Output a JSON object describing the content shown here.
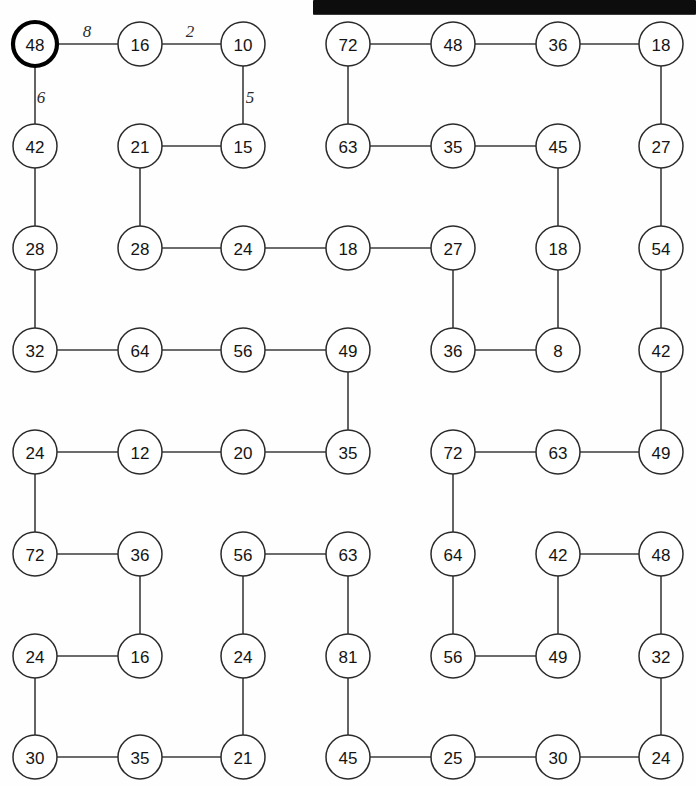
{
  "page": {
    "background_color": "#ffffff",
    "ink_color": "#2b2b2b",
    "width": 696,
    "height": 786
  },
  "scan_artifact": {
    "name": "black-bar",
    "color": "#0d0d0d",
    "x": 313,
    "y": 0,
    "width": 383,
    "height": 14
  },
  "layout": {
    "columns_x": [
      35,
      140,
      243,
      348,
      453,
      558,
      661
    ],
    "rows_y": [
      44,
      146,
      248,
      350,
      452,
      554,
      656,
      757
    ],
    "node_radius": 22
  },
  "chart_data": {
    "type": "diagram",
    "node_count": 56,
    "start_node": "n0-0",
    "nodes": [
      {
        "id": "n0-0",
        "value": "48",
        "col": 0,
        "row": 0,
        "highlighted": true
      },
      {
        "id": "n1-0",
        "value": "16",
        "col": 1,
        "row": 0,
        "highlighted": false
      },
      {
        "id": "n2-0",
        "value": "10",
        "col": 2,
        "row": 0,
        "highlighted": false
      },
      {
        "id": "n3-0",
        "value": "72",
        "col": 3,
        "row": 0,
        "highlighted": false
      },
      {
        "id": "n4-0",
        "value": "48",
        "col": 4,
        "row": 0,
        "highlighted": false
      },
      {
        "id": "n5-0",
        "value": "36",
        "col": 5,
        "row": 0,
        "highlighted": false
      },
      {
        "id": "n6-0",
        "value": "18",
        "col": 6,
        "row": 0,
        "highlighted": false
      },
      {
        "id": "n0-1",
        "value": "42",
        "col": 0,
        "row": 1,
        "highlighted": false
      },
      {
        "id": "n1-1",
        "value": "21",
        "col": 1,
        "row": 1,
        "highlighted": false
      },
      {
        "id": "n2-1",
        "value": "15",
        "col": 2,
        "row": 1,
        "highlighted": false
      },
      {
        "id": "n3-1",
        "value": "63",
        "col": 3,
        "row": 1,
        "highlighted": false
      },
      {
        "id": "n4-1",
        "value": "35",
        "col": 4,
        "row": 1,
        "highlighted": false
      },
      {
        "id": "n5-1",
        "value": "45",
        "col": 5,
        "row": 1,
        "highlighted": false
      },
      {
        "id": "n6-1",
        "value": "27",
        "col": 6,
        "row": 1,
        "highlighted": false
      },
      {
        "id": "n0-2",
        "value": "28",
        "col": 0,
        "row": 2,
        "highlighted": false
      },
      {
        "id": "n1-2",
        "value": "28",
        "col": 1,
        "row": 2,
        "highlighted": false
      },
      {
        "id": "n2-2",
        "value": "24",
        "col": 2,
        "row": 2,
        "highlighted": false
      },
      {
        "id": "n3-2",
        "value": "18",
        "col": 3,
        "row": 2,
        "highlighted": false
      },
      {
        "id": "n4-2",
        "value": "27",
        "col": 4,
        "row": 2,
        "highlighted": false
      },
      {
        "id": "n5-2",
        "value": "18",
        "col": 5,
        "row": 2,
        "highlighted": false
      },
      {
        "id": "n6-2",
        "value": "54",
        "col": 6,
        "row": 2,
        "highlighted": false
      },
      {
        "id": "n0-3",
        "value": "32",
        "col": 0,
        "row": 3,
        "highlighted": false
      },
      {
        "id": "n1-3",
        "value": "64",
        "col": 1,
        "row": 3,
        "highlighted": false
      },
      {
        "id": "n2-3",
        "value": "56",
        "col": 2,
        "row": 3,
        "highlighted": false
      },
      {
        "id": "n3-3",
        "value": "49",
        "col": 3,
        "row": 3,
        "highlighted": false
      },
      {
        "id": "n4-3",
        "value": "36",
        "col": 4,
        "row": 3,
        "highlighted": false
      },
      {
        "id": "n5-3",
        "value": "8",
        "col": 5,
        "row": 3,
        "highlighted": false
      },
      {
        "id": "n6-3",
        "value": "42",
        "col": 6,
        "row": 3,
        "highlighted": false
      },
      {
        "id": "n0-4",
        "value": "24",
        "col": 0,
        "row": 4,
        "highlighted": false
      },
      {
        "id": "n1-4",
        "value": "12",
        "col": 1,
        "row": 4,
        "highlighted": false
      },
      {
        "id": "n2-4",
        "value": "20",
        "col": 2,
        "row": 4,
        "highlighted": false
      },
      {
        "id": "n3-4",
        "value": "35",
        "col": 3,
        "row": 4,
        "highlighted": false
      },
      {
        "id": "n4-4",
        "value": "72",
        "col": 4,
        "row": 4,
        "highlighted": false
      },
      {
        "id": "n5-4",
        "value": "63",
        "col": 5,
        "row": 4,
        "highlighted": false
      },
      {
        "id": "n6-4",
        "value": "49",
        "col": 6,
        "row": 4,
        "highlighted": false
      },
      {
        "id": "n0-5",
        "value": "72",
        "col": 0,
        "row": 5,
        "highlighted": false
      },
      {
        "id": "n1-5",
        "value": "36",
        "col": 1,
        "row": 5,
        "highlighted": false
      },
      {
        "id": "n2-5",
        "value": "56",
        "col": 2,
        "row": 5,
        "highlighted": false
      },
      {
        "id": "n3-5",
        "value": "63",
        "col": 3,
        "row": 5,
        "highlighted": false
      },
      {
        "id": "n4-5",
        "value": "64",
        "col": 4,
        "row": 5,
        "highlighted": false
      },
      {
        "id": "n5-5",
        "value": "42",
        "col": 5,
        "row": 5,
        "highlighted": false
      },
      {
        "id": "n6-5",
        "value": "48",
        "col": 6,
        "row": 5,
        "highlighted": false
      },
      {
        "id": "n0-6",
        "value": "24",
        "col": 0,
        "row": 6,
        "highlighted": false
      },
      {
        "id": "n1-6",
        "value": "16",
        "col": 1,
        "row": 6,
        "highlighted": false
      },
      {
        "id": "n2-6",
        "value": "24",
        "col": 2,
        "row": 6,
        "highlighted": false
      },
      {
        "id": "n3-6",
        "value": "81",
        "col": 3,
        "row": 6,
        "highlighted": false
      },
      {
        "id": "n4-6",
        "value": "56",
        "col": 4,
        "row": 6,
        "highlighted": false
      },
      {
        "id": "n5-6",
        "value": "49",
        "col": 5,
        "row": 6,
        "highlighted": false
      },
      {
        "id": "n6-6",
        "value": "32",
        "col": 6,
        "row": 6,
        "highlighted": false
      },
      {
        "id": "n0-7",
        "value": "30",
        "col": 0,
        "row": 7,
        "highlighted": false
      },
      {
        "id": "n1-7",
        "value": "35",
        "col": 1,
        "row": 7,
        "highlighted": false
      },
      {
        "id": "n2-7",
        "value": "21",
        "col": 2,
        "row": 7,
        "highlighted": false
      },
      {
        "id": "n3-7",
        "value": "45",
        "col": 3,
        "row": 7,
        "highlighted": false
      },
      {
        "id": "n4-7",
        "value": "25",
        "col": 4,
        "row": 7,
        "highlighted": false
      },
      {
        "id": "n5-7",
        "value": "30",
        "col": 5,
        "row": 7,
        "highlighted": false
      },
      {
        "id": "n6-7",
        "value": "24",
        "col": 6,
        "row": 7,
        "highlighted": false
      }
    ],
    "edges": [
      {
        "from": "n0-0",
        "to": "n1-0"
      },
      {
        "from": "n1-0",
        "to": "n2-0"
      },
      {
        "from": "n2-0",
        "to": "n2-1"
      },
      {
        "from": "n0-0",
        "to": "n0-1"
      },
      {
        "from": "n1-1",
        "to": "n2-1"
      },
      {
        "from": "n1-1",
        "to": "n1-2"
      },
      {
        "from": "n0-1",
        "to": "n0-2"
      },
      {
        "from": "n0-2",
        "to": "n0-3"
      },
      {
        "from": "n1-2",
        "to": "n2-2"
      },
      {
        "from": "n2-2",
        "to": "n3-2"
      },
      {
        "from": "n3-2",
        "to": "n4-2"
      },
      {
        "from": "n0-3",
        "to": "n1-3"
      },
      {
        "from": "n1-3",
        "to": "n2-3"
      },
      {
        "from": "n2-3",
        "to": "n3-3"
      },
      {
        "from": "n3-3",
        "to": "n3-4"
      },
      {
        "from": "n4-2",
        "to": "n4-3"
      },
      {
        "from": "n4-3",
        "to": "n5-3"
      },
      {
        "from": "n5-3",
        "to": "n5-2"
      },
      {
        "from": "n5-2",
        "to": "n5-1"
      },
      {
        "from": "n3-0",
        "to": "n4-0"
      },
      {
        "from": "n4-0",
        "to": "n5-0"
      },
      {
        "from": "n5-0",
        "to": "n6-0"
      },
      {
        "from": "n3-0",
        "to": "n3-1"
      },
      {
        "from": "n3-1",
        "to": "n4-1"
      },
      {
        "from": "n4-1",
        "to": "n5-1"
      },
      {
        "from": "n6-0",
        "to": "n6-1"
      },
      {
        "from": "n6-1",
        "to": "n6-2"
      },
      {
        "from": "n6-2",
        "to": "n6-3"
      },
      {
        "from": "n6-3",
        "to": "n6-4"
      },
      {
        "from": "n0-4",
        "to": "n1-4"
      },
      {
        "from": "n1-4",
        "to": "n2-4"
      },
      {
        "from": "n2-4",
        "to": "n3-4"
      },
      {
        "from": "n0-4",
        "to": "n0-5"
      },
      {
        "from": "n0-5",
        "to": "n1-5"
      },
      {
        "from": "n1-5",
        "to": "n1-6"
      },
      {
        "from": "n0-6",
        "to": "n1-6"
      },
      {
        "from": "n0-6",
        "to": "n0-7"
      },
      {
        "from": "n0-7",
        "to": "n1-7"
      },
      {
        "from": "n1-7",
        "to": "n2-7"
      },
      {
        "from": "n2-5",
        "to": "n3-5"
      },
      {
        "from": "n2-5",
        "to": "n2-6"
      },
      {
        "from": "n2-6",
        "to": "n2-7"
      },
      {
        "from": "n3-5",
        "to": "n3-6"
      },
      {
        "from": "n3-6",
        "to": "n3-7"
      },
      {
        "from": "n3-7",
        "to": "n4-7"
      },
      {
        "from": "n4-7",
        "to": "n5-7"
      },
      {
        "from": "n5-7",
        "to": "n6-7"
      },
      {
        "from": "n4-4",
        "to": "n5-4"
      },
      {
        "from": "n5-4",
        "to": "n6-4"
      },
      {
        "from": "n4-4",
        "to": "n4-5"
      },
      {
        "from": "n4-5",
        "to": "n4-6"
      },
      {
        "from": "n4-6",
        "to": "n5-6"
      },
      {
        "from": "n5-6",
        "to": "n5-5"
      },
      {
        "from": "n5-5",
        "to": "n6-5"
      },
      {
        "from": "n6-5",
        "to": "n6-6"
      },
      {
        "from": "n6-6",
        "to": "n6-7"
      }
    ],
    "edge_labels": [
      {
        "id": "lbl-8",
        "text": "8",
        "x": 87,
        "y": 31,
        "edge": "n0-0 -> n1-0"
      },
      {
        "id": "lbl-2",
        "text": "2",
        "x": 190,
        "y": 31,
        "edge": "n1-0 -> n2-0"
      },
      {
        "id": "lbl-6",
        "text": "6",
        "x": 41,
        "y": 97,
        "edge": "n0-0 -> n0-1"
      },
      {
        "id": "lbl-5",
        "text": "5",
        "x": 250,
        "y": 97,
        "edge": "n2-0 -> n2-1"
      }
    ]
  }
}
